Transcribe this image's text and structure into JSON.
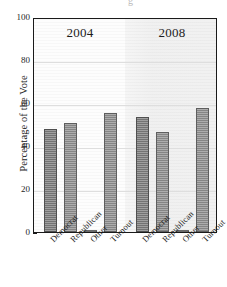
{
  "figure": {
    "axis_title_y": "Percentage of the Vote",
    "top_artifact": "g",
    "groups": [
      {
        "label": "2004"
      },
      {
        "label": "2008"
      }
    ]
  },
  "chart_data": {
    "type": "bar",
    "title": "",
    "xlabel": "",
    "ylabel": "Percentage of the Vote",
    "ylim": [
      0,
      100
    ],
    "yticks": [
      0,
      20,
      40,
      60,
      80,
      100
    ],
    "ytick_labels": [
      "0",
      "20",
      "40",
      "60",
      "80",
      "100"
    ],
    "grid": true,
    "legend": "none",
    "group_labels": [
      "2004",
      "2008"
    ],
    "categories": [
      "Democrat",
      "Republican",
      "Other",
      "Turnout"
    ],
    "series": [
      {
        "name": "2004",
        "values": [
          48,
          50.5,
          1,
          55.5
        ]
      },
      {
        "name": "2008",
        "values": [
          53.5,
          46.5,
          1,
          57.5
        ]
      }
    ],
    "bars": [
      {
        "group": "2004",
        "category": "Democrat",
        "value": 48
      },
      {
        "group": "2004",
        "category": "Republican",
        "value": 50.5
      },
      {
        "group": "2004",
        "category": "Other",
        "value": 1
      },
      {
        "group": "2004",
        "category": "Turnout",
        "value": 55.5
      },
      {
        "group": "2008",
        "category": "Democrat",
        "value": 53.5
      },
      {
        "group": "2008",
        "category": "Republican",
        "value": 46.5
      },
      {
        "group": "2008",
        "category": "Other",
        "value": 1
      },
      {
        "group": "2008",
        "category": "Turnout",
        "value": 57.5
      }
    ],
    "colors": {
      "bar_fill": "#8d8d8d",
      "bar_fill_dark": "#7a7a7a",
      "bar_fill_light": "#f7f7f7",
      "bar_edge": "#5e5e5e",
      "panel_2004": "#fdfdfd",
      "panel_2008": "#eeeeee",
      "gridline": "#dedede",
      "axis": "#1a1a1a",
      "text": "#1c1c1c"
    }
  }
}
